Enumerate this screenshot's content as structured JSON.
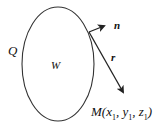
{
  "diagram": {
    "region": {
      "label": "W",
      "boundary_label": "Q",
      "shape": "ellipse"
    },
    "vectors": [
      {
        "name": "normal",
        "label": "n"
      },
      {
        "name": "radius",
        "label": "r"
      }
    ],
    "point": {
      "name": "M",
      "open": "(",
      "x": "x",
      "y": "y",
      "z": "z",
      "sub": "1",
      "sep": ", ",
      "close": ")"
    },
    "colors": {
      "stroke": "#222222",
      "text": "#111111",
      "background": "#ffffff"
    }
  }
}
